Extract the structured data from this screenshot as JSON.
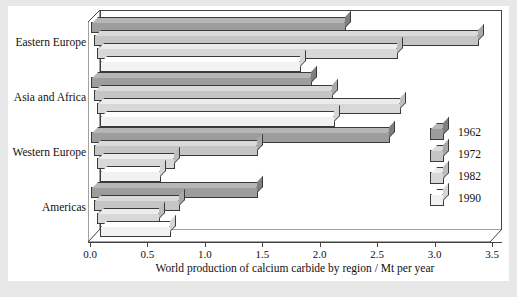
{
  "chart_data": {
    "type": "bar",
    "orientation": "horizontal",
    "grouped": true,
    "title": "",
    "xlabel": "World production of calcium carbide by region / Mt per year",
    "ylabel": "",
    "xlim": [
      0.0,
      3.5
    ],
    "xticks": [
      "0.0",
      "0.5",
      "1.0",
      "1.5",
      "2.0",
      "2.5",
      "3.0",
      "3.5"
    ],
    "xtick_values": [
      0.0,
      0.5,
      1.0,
      1.5,
      2.0,
      2.5,
      3.0,
      3.5
    ],
    "grid": false,
    "legend_position": "right",
    "categories": [
      "Eastern Europe",
      "Asia and Africa",
      "Western Europe",
      "Americas"
    ],
    "series": [
      {
        "name": "1962",
        "values": [
          2.22,
          1.92,
          2.6,
          1.45
        ]
      },
      {
        "name": "1972",
        "values": [
          3.35,
          2.08,
          1.43,
          0.75
        ]
      },
      {
        "name": "1982",
        "values": [
          2.62,
          2.65,
          0.68,
          0.55
        ]
      },
      {
        "name": "1990",
        "values": [
          1.75,
          2.05,
          0.53,
          0.62
        ]
      }
    ],
    "series_colors": [
      "#9d9d9d",
      "#c5c5c5",
      "#d8d8d8",
      "#f2f2f2"
    ],
    "units": "Mt per year"
  },
  "axis": {
    "x_title": "World production of calcium carbide by region / Mt per year",
    "ticks": [
      {
        "label": "0.0",
        "value": 0.0
      },
      {
        "label": "0.5",
        "value": 0.5
      },
      {
        "label": "1.0",
        "value": 1.0
      },
      {
        "label": "1.5",
        "value": 1.5
      },
      {
        "label": "2.0",
        "value": 2.0
      },
      {
        "label": "2.5",
        "value": 2.5
      },
      {
        "label": "3.0",
        "value": 3.0
      },
      {
        "label": "3.5",
        "value": 3.5
      }
    ]
  },
  "categories": [
    {
      "label": "Eastern Europe"
    },
    {
      "label": "Asia and Africa"
    },
    {
      "label": "Western Europe"
    },
    {
      "label": "Americas"
    }
  ],
  "legend": {
    "entries": [
      {
        "label": "1962",
        "tone": "tone-1962"
      },
      {
        "label": "1972",
        "tone": "tone-1972"
      },
      {
        "label": "1982",
        "tone": "tone-1982"
      },
      {
        "label": "1990",
        "tone": "tone-1990"
      }
    ]
  },
  "caption": ""
}
